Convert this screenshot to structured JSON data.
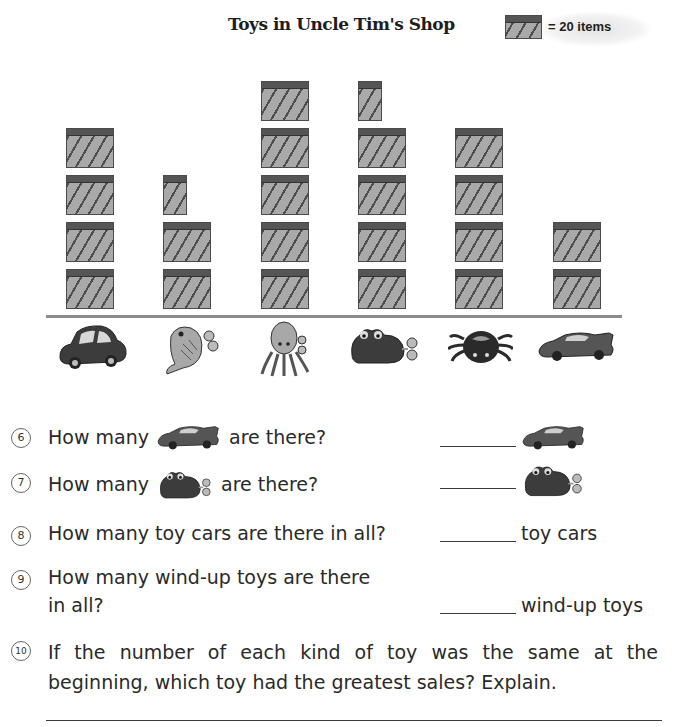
{
  "chart_data": {
    "type": "pictograph",
    "title": "Toys in Uncle Tim's Shop",
    "legend": {
      "symbol": "box",
      "value": 20,
      "label": "= 20 items"
    },
    "categories": [
      "toy car",
      "wind-up fish",
      "wind-up octopus",
      "wind-up frog",
      "wind-up spider",
      "race car"
    ],
    "symbols": [
      4,
      2.5,
      5,
      4.5,
      4,
      2
    ],
    "values": [
      80,
      50,
      100,
      90,
      80,
      40
    ],
    "xlabel": "",
    "ylabel": "",
    "grid": false,
    "legend_position": "top-right"
  },
  "worksheet": {
    "title": "Toys in Uncle Tim's Shop",
    "legend_label": "= 20 items",
    "questions": [
      {
        "num": "6",
        "before": "How many",
        "after": "are there?",
        "icon": "race-car-icon"
      },
      {
        "num": "7",
        "before": "How many",
        "after": "are there?",
        "icon": "wind-up-frog-icon"
      },
      {
        "num": "8",
        "text": "How many toy cars are there in all?",
        "unit": "toy cars"
      },
      {
        "num": "9",
        "line1": "How many wind-up toys are there",
        "line2": "in all?",
        "unit": "wind-up toys"
      },
      {
        "num": "10",
        "text": "If the number of each kind of toy was the same at the beginning, which toy had the greatest sales? Explain."
      }
    ]
  }
}
